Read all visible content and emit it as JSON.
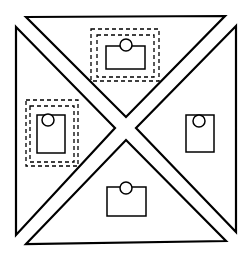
{
  "diagram": {
    "width": 248,
    "height": 257,
    "stroke_color": "#000000",
    "fill_color": "#ffffff",
    "regions": [
      {
        "name": "top",
        "points": "26,17 225,16 126,117",
        "card": {
          "x": 106,
          "y": 46,
          "w": 39,
          "h": 23,
          "cx": 126,
          "cy": 45,
          "r": 6
        },
        "selection": {
          "outer": {
            "x": 91,
            "y": 29,
            "w": 68,
            "h": 52
          },
          "inner": {
            "x": 97,
            "y": 35,
            "w": 57,
            "h": 42
          }
        }
      },
      {
        "name": "left",
        "points": "16,27 115,128 16,235",
        "card": {
          "x": 37,
          "y": 115,
          "w": 28,
          "h": 38,
          "cx": 48,
          "cy": 120,
          "r": 6
        },
        "selection": {
          "outer": {
            "x": 26,
            "y": 100,
            "w": 52,
            "h": 66
          },
          "inner": {
            "x": 30,
            "y": 106,
            "w": 44,
            "h": 56
          }
        }
      },
      {
        "name": "right",
        "points": "236,26 136,128 236,232",
        "card": {
          "x": 186,
          "y": 115,
          "w": 28,
          "h": 37,
          "cx": 199,
          "cy": 121,
          "r": 6
        },
        "selection": null
      },
      {
        "name": "bottom",
        "points": "26,244 126,140 226,241",
        "card": {
          "x": 107,
          "y": 187,
          "w": 39,
          "h": 29,
          "cx": 126,
          "cy": 188,
          "r": 6
        },
        "selection": null
      }
    ]
  }
}
